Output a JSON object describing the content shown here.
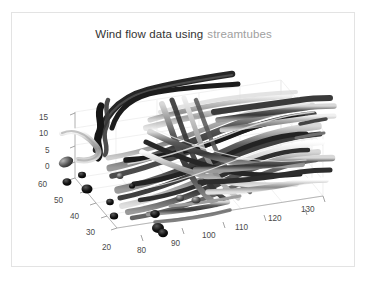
{
  "figure": {
    "width": 367,
    "height": 285,
    "background": "#ffffff",
    "border_color": "#e3e3e3"
  },
  "title": {
    "main_text": "Wind flow data using",
    "accent_text": "streamtubes",
    "main_color": "#333333",
    "accent_color": "#a0a0a0"
  },
  "chart_data": {
    "type": "scatter",
    "render": "3d-streamtubes",
    "xlabel": "",
    "ylabel": "",
    "zlabel": "",
    "grid": true,
    "legend": "none",
    "projection": "3d-isometric",
    "colormap": "grayscale",
    "xlim": [
      75,
      135
    ],
    "ylim": [
      15,
      65
    ],
    "zlim": [
      -1,
      17
    ],
    "x_ticks": [
      80,
      90,
      100,
      110,
      120,
      130
    ],
    "y_ticks": [
      60,
      50,
      40,
      30,
      20
    ],
    "z_ticks": [
      15,
      10,
      5,
      0
    ],
    "x_tick_labels": [
      "80",
      "90",
      "100",
      "110",
      "120",
      "130"
    ],
    "y_tick_labels": [
      "60",
      "50",
      "40",
      "30",
      "20"
    ],
    "z_tick_labels": [
      "15",
      "10",
      "5",
      "0"
    ],
    "series": [
      {
        "name": "streamtubes",
        "description": "Grayscale shaded 3D stream tubes tracing wind velocity field, flowing left to right",
        "tube_count": 34,
        "seed_blob_count": 11,
        "shading": "interp-gray",
        "value_range": [
          0,
          1
        ]
      }
    ],
    "axes_pixel_frame": {
      "origin_front_left": [
        75,
        178
      ],
      "origin_front_bottom": [
        117,
        239
      ],
      "x_axis_end": [
        330,
        182
      ],
      "y_axis_end": [
        75,
        178
      ],
      "z_axis_top": [
        75,
        112
      ]
    }
  },
  "tick_positions": {
    "z": [
      {
        "label": "15",
        "x": 39,
        "y": 113
      },
      {
        "label": "10",
        "x": 39,
        "y": 129
      },
      {
        "label": "5",
        "x": 45,
        "y": 146
      },
      {
        "label": "0",
        "x": 45,
        "y": 162
      }
    ],
    "y": [
      {
        "label": "60",
        "x": 38,
        "y": 180
      },
      {
        "label": "50",
        "x": 54,
        "y": 196
      },
      {
        "label": "40",
        "x": 70,
        "y": 212
      },
      {
        "label": "30",
        "x": 86,
        "y": 228
      },
      {
        "label": "20",
        "x": 102,
        "y": 243
      }
    ],
    "x": [
      {
        "label": "80",
        "x": 137,
        "y": 246
      },
      {
        "label": "90",
        "x": 171,
        "y": 239
      },
      {
        "label": "100",
        "x": 202,
        "y": 231
      },
      {
        "label": "110",
        "x": 235,
        "y": 223
      },
      {
        "label": "120",
        "x": 268,
        "y": 214
      },
      {
        "label": "130",
        "x": 301,
        "y": 205
      }
    ]
  },
  "colors": {
    "grid_line": "#e8e8e8",
    "axis_line": "#b8b8b8",
    "tick_text": "#4a4a4a",
    "tube_dark": "#1f1f1f",
    "tube_mid": "#6e6e6e",
    "tube_light": "#c9c9c9"
  }
}
